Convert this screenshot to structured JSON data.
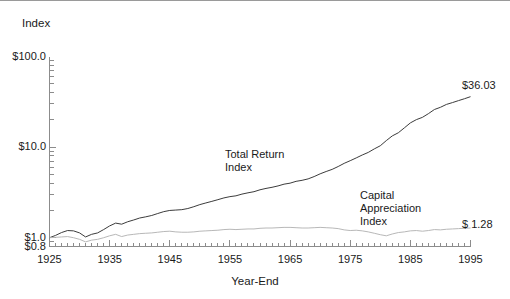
{
  "chart_data": {
    "type": "line",
    "title": "",
    "xlabel": "Year-End",
    "ylabel": "Index",
    "yscale": "log",
    "ylim": [
      0.8,
      100.0
    ],
    "xlim": [
      1925,
      1995
    ],
    "grid": false,
    "legend": "annotations-inline",
    "ytick_labels": [
      "$100.0",
      "$10.0",
      "$1.0",
      "$0.8"
    ],
    "ytick_values": [
      100.0,
      10.0,
      1.0,
      0.8
    ],
    "xtick_labels": [
      "1925",
      "1935",
      "1945",
      "1955",
      "1965",
      "1975",
      "1985",
      "1995"
    ],
    "xtick_values": [
      1925,
      1935,
      1945,
      1955,
      1965,
      1975,
      1985,
      1995
    ],
    "annotations": [
      {
        "text": "Total Return\nIndex",
        "series": "Total Return Index"
      },
      {
        "text": "Capital\nAppreciation\nIndex",
        "series": "Capital Appreciation Index"
      }
    ],
    "end_labels": [
      {
        "text": "$36.03",
        "value": 36.03,
        "series": "Total Return Index"
      },
      {
        "text": "$ 1.28",
        "value": 1.28,
        "series": "Capital Appreciation Index"
      }
    ],
    "x": [
      1925,
      1926,
      1927,
      1928,
      1929,
      1930,
      1931,
      1932,
      1933,
      1934,
      1935,
      1936,
      1937,
      1938,
      1939,
      1940,
      1941,
      1942,
      1943,
      1944,
      1945,
      1946,
      1947,
      1948,
      1949,
      1950,
      1951,
      1952,
      1953,
      1954,
      1955,
      1956,
      1957,
      1958,
      1959,
      1960,
      1961,
      1962,
      1963,
      1964,
      1965,
      1966,
      1967,
      1968,
      1969,
      1970,
      1971,
      1972,
      1973,
      1974,
      1975,
      1976,
      1977,
      1978,
      1979,
      1980,
      1981,
      1982,
      1983,
      1984,
      1985,
      1986,
      1987,
      1988,
      1989,
      1990,
      1991,
      1992,
      1993,
      1994,
      1995
    ],
    "series": [
      {
        "name": "Total Return Index",
        "color": "#3c3c3c",
        "values": [
          1.0,
          1.06,
          1.14,
          1.2,
          1.19,
          1.13,
          1.02,
          1.09,
          1.13,
          1.23,
          1.35,
          1.45,
          1.41,
          1.5,
          1.57,
          1.65,
          1.7,
          1.76,
          1.85,
          1.94,
          2.0,
          2.02,
          2.04,
          2.1,
          2.2,
          2.32,
          2.42,
          2.52,
          2.63,
          2.75,
          2.84,
          2.9,
          3.03,
          3.13,
          3.22,
          3.38,
          3.5,
          3.6,
          3.73,
          3.9,
          4.0,
          4.19,
          4.3,
          4.46,
          4.73,
          5.07,
          5.38,
          5.68,
          6.11,
          6.62,
          7.08,
          7.6,
          8.18,
          8.74,
          9.55,
          10.35,
          11.8,
          13.3,
          14.4,
          16.3,
          18.5,
          20.1,
          21.3,
          23.4,
          26.0,
          27.5,
          29.6,
          31.0,
          32.6,
          34.2,
          36.03
        ]
      },
      {
        "name": "Capital Appreciation Index",
        "color": "#b8b8b8",
        "values": [
          1.0,
          1.01,
          1.02,
          1.03,
          1.0,
          0.96,
          0.9,
          0.94,
          0.96,
          1.0,
          1.05,
          1.09,
          1.03,
          1.07,
          1.09,
          1.11,
          1.12,
          1.13,
          1.15,
          1.17,
          1.18,
          1.16,
          1.15,
          1.15,
          1.16,
          1.18,
          1.19,
          1.2,
          1.21,
          1.23,
          1.24,
          1.23,
          1.24,
          1.25,
          1.25,
          1.27,
          1.28,
          1.28,
          1.29,
          1.3,
          1.3,
          1.29,
          1.28,
          1.28,
          1.29,
          1.3,
          1.29,
          1.28,
          1.26,
          1.22,
          1.2,
          1.21,
          1.19,
          1.16,
          1.12,
          1.08,
          1.05,
          1.1,
          1.14,
          1.16,
          1.19,
          1.2,
          1.18,
          1.2,
          1.23,
          1.22,
          1.24,
          1.25,
          1.26,
          1.27,
          1.28
        ]
      }
    ]
  }
}
